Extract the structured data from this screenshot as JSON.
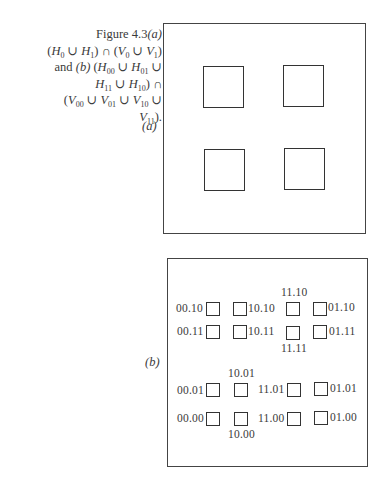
{
  "caption": {
    "figure": "Figure 4.3",
    "part_a": "(a)",
    "part_b": "(b)",
    "and": "and",
    "line1_expr": "(H0 ∪ H1) ∩ (V0 ∪ V1)",
    "line_b_expr": "(H00 ∪ H01 ∪ H11 ∪ H10) ∩ (V00 ∪ V01 ∪ V10 ∪ V11)."
  },
  "panel_a": {
    "label": "(a)",
    "squares": 4
  },
  "panel_b": {
    "label": "(b)",
    "labels": {
      "r1c1": "00.10",
      "r1c2": "10.10",
      "r1c3": "11.10",
      "r1c4": "01.10",
      "r2c1": "00.11",
      "r2c2": "10.11",
      "r2c3": "11.11",
      "r2c4": "01.11",
      "r3c1": "00.01",
      "r3c2": "10.01",
      "r3c3": "11.01",
      "r3c4": "01.01",
      "r4c1": "00.00",
      "r4c2": "10.00",
      "r4c3": "11.00",
      "r4c4": "01.00"
    }
  }
}
